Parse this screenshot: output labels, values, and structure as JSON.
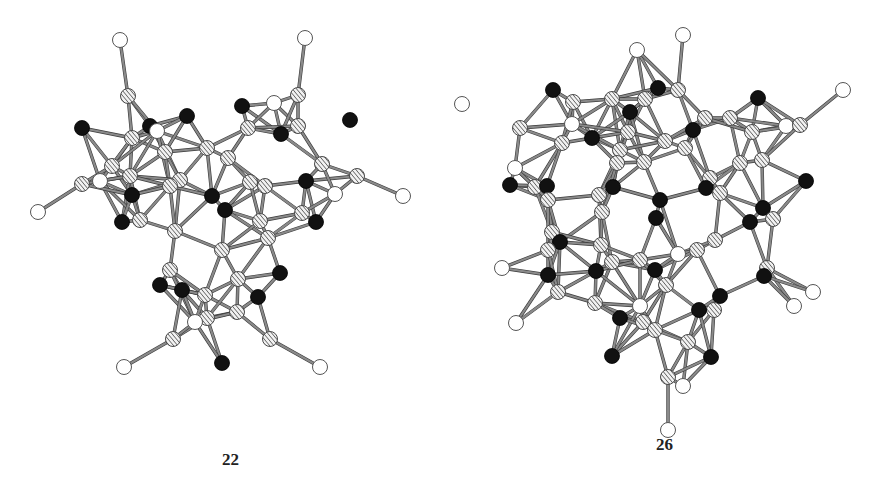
{
  "figure": {
    "structures": [
      {
        "id": "left",
        "label": "22",
        "atom_types": {
          "black": "#111111",
          "hatched": "striped gray",
          "white": "#ffffff"
        },
        "atoms": [
          {
            "t": "w",
            "x": 120,
            "y": 40
          },
          {
            "t": "h",
            "x": 128,
            "y": 96
          },
          {
            "t": "b",
            "x": 82,
            "y": 128
          },
          {
            "t": "h",
            "x": 132,
            "y": 138
          },
          {
            "t": "b",
            "x": 150,
            "y": 126
          },
          {
            "t": "w",
            "x": 157,
            "y": 131
          },
          {
            "t": "b",
            "x": 187,
            "y": 116
          },
          {
            "t": "b",
            "x": 242,
            "y": 106
          },
          {
            "t": "w",
            "x": 274,
            "y": 103
          },
          {
            "t": "h",
            "x": 298,
            "y": 95
          },
          {
            "t": "w",
            "x": 305,
            "y": 38
          },
          {
            "t": "b",
            "x": 350,
            "y": 120
          },
          {
            "t": "h",
            "x": 298,
            "y": 126
          },
          {
            "t": "b",
            "x": 281,
            "y": 134
          },
          {
            "t": "h",
            "x": 248,
            "y": 128
          },
          {
            "t": "h",
            "x": 207,
            "y": 148
          },
          {
            "t": "h",
            "x": 228,
            "y": 158
          },
          {
            "t": "h",
            "x": 165,
            "y": 152
          },
          {
            "t": "h",
            "x": 112,
            "y": 166
          },
          {
            "t": "h",
            "x": 130,
            "y": 176
          },
          {
            "t": "w",
            "x": 100,
            "y": 181
          },
          {
            "t": "h",
            "x": 82,
            "y": 184
          },
          {
            "t": "w",
            "x": 38,
            "y": 212
          },
          {
            "t": "b",
            "x": 132,
            "y": 195
          },
          {
            "t": "h",
            "x": 180,
            "y": 180
          },
          {
            "t": "h",
            "x": 170,
            "y": 186
          },
          {
            "t": "b",
            "x": 212,
            "y": 196
          },
          {
            "t": "b",
            "x": 225,
            "y": 210
          },
          {
            "t": "h",
            "x": 250,
            "y": 182
          },
          {
            "t": "h",
            "x": 265,
            "y": 186
          },
          {
            "t": "b",
            "x": 306,
            "y": 181
          },
          {
            "t": "w",
            "x": 335,
            "y": 194
          },
          {
            "t": "h",
            "x": 357,
            "y": 176
          },
          {
            "t": "w",
            "x": 403,
            "y": 196
          },
          {
            "t": "h",
            "x": 322,
            "y": 164
          },
          {
            "t": "h",
            "x": 302,
            "y": 213
          },
          {
            "t": "h",
            "x": 260,
            "y": 221
          },
          {
            "t": "b",
            "x": 316,
            "y": 222
          },
          {
            "t": "b",
            "x": 122,
            "y": 222
          },
          {
            "t": "h",
            "x": 140,
            "y": 220
          },
          {
            "t": "h",
            "x": 175,
            "y": 231
          },
          {
            "t": "h",
            "x": 268,
            "y": 238
          },
          {
            "t": "h",
            "x": 222,
            "y": 250
          },
          {
            "t": "h",
            "x": 170,
            "y": 270
          },
          {
            "t": "b",
            "x": 160,
            "y": 285
          },
          {
            "t": "b",
            "x": 182,
            "y": 290
          },
          {
            "t": "h",
            "x": 205,
            "y": 295
          },
          {
            "t": "h",
            "x": 238,
            "y": 279
          },
          {
            "t": "b",
            "x": 280,
            "y": 273
          },
          {
            "t": "b",
            "x": 258,
            "y": 297
          },
          {
            "t": "h",
            "x": 207,
            "y": 318
          },
          {
            "t": "h",
            "x": 237,
            "y": 312
          },
          {
            "t": "w",
            "x": 195,
            "y": 322
          },
          {
            "t": "h",
            "x": 173,
            "y": 339
          },
          {
            "t": "h",
            "x": 270,
            "y": 339
          },
          {
            "t": "b",
            "x": 222,
            "y": 363
          },
          {
            "t": "w",
            "x": 124,
            "y": 367
          },
          {
            "t": "w",
            "x": 320,
            "y": 367
          }
        ]
      },
      {
        "id": "right",
        "label": "26",
        "atom_types": {
          "black": "#111111",
          "hatched": "striped gray",
          "white": "#ffffff"
        },
        "atoms": [
          {
            "t": "w",
            "x": 683,
            "y": 35
          },
          {
            "t": "w",
            "x": 637,
            "y": 50
          },
          {
            "t": "b",
            "x": 553,
            "y": 90
          },
          {
            "t": "b",
            "x": 658,
            "y": 88
          },
          {
            "t": "h",
            "x": 678,
            "y": 90
          },
          {
            "t": "h",
            "x": 573,
            "y": 102
          },
          {
            "t": "h",
            "x": 612,
            "y": 99
          },
          {
            "t": "h",
            "x": 645,
            "y": 99
          },
          {
            "t": "b",
            "x": 630,
            "y": 112
          },
          {
            "t": "w",
            "x": 462,
            "y": 104
          },
          {
            "t": "w",
            "x": 843,
            "y": 90
          },
          {
            "t": "b",
            "x": 758,
            "y": 98
          },
          {
            "t": "h",
            "x": 730,
            "y": 118
          },
          {
            "t": "b",
            "x": 592,
            "y": 138
          },
          {
            "t": "b",
            "x": 693,
            "y": 130
          },
          {
            "t": "h",
            "x": 520,
            "y": 128
          },
          {
            "t": "w",
            "x": 572,
            "y": 124
          },
          {
            "t": "h",
            "x": 628,
            "y": 132
          },
          {
            "t": "h",
            "x": 705,
            "y": 118
          },
          {
            "t": "w",
            "x": 786,
            "y": 126
          },
          {
            "t": "h",
            "x": 800,
            "y": 125
          },
          {
            "t": "h",
            "x": 752,
            "y": 132
          },
          {
            "t": "h",
            "x": 562,
            "y": 143
          },
          {
            "t": "h",
            "x": 665,
            "y": 141
          },
          {
            "t": "h",
            "x": 685,
            "y": 148
          },
          {
            "t": "h",
            "x": 620,
            "y": 150
          },
          {
            "t": "h",
            "x": 617,
            "y": 163
          },
          {
            "t": "h",
            "x": 644,
            "y": 162
          },
          {
            "t": "w",
            "x": 515,
            "y": 168
          },
          {
            "t": "h",
            "x": 740,
            "y": 163
          },
          {
            "t": "h",
            "x": 762,
            "y": 160
          },
          {
            "t": "b",
            "x": 510,
            "y": 185
          },
          {
            "t": "h",
            "x": 535,
            "y": 187
          },
          {
            "t": "b",
            "x": 547,
            "y": 186
          },
          {
            "t": "h",
            "x": 710,
            "y": 178
          },
          {
            "t": "b",
            "x": 613,
            "y": 187
          },
          {
            "t": "b",
            "x": 706,
            "y": 188
          },
          {
            "t": "h",
            "x": 720,
            "y": 193
          },
          {
            "t": "b",
            "x": 806,
            "y": 181
          },
          {
            "t": "h",
            "x": 599,
            "y": 195
          },
          {
            "t": "b",
            "x": 660,
            "y": 200
          },
          {
            "t": "h",
            "x": 548,
            "y": 200
          },
          {
            "t": "b",
            "x": 763,
            "y": 208
          },
          {
            "t": "h",
            "x": 602,
            "y": 212
          },
          {
            "t": "b",
            "x": 656,
            "y": 218
          },
          {
            "t": "h",
            "x": 773,
            "y": 219
          },
          {
            "t": "b",
            "x": 750,
            "y": 222
          },
          {
            "t": "h",
            "x": 552,
            "y": 232
          },
          {
            "t": "b",
            "x": 560,
            "y": 242
          },
          {
            "t": "h",
            "x": 601,
            "y": 245
          },
          {
            "t": "h",
            "x": 715,
            "y": 240
          },
          {
            "t": "h",
            "x": 697,
            "y": 250
          },
          {
            "t": "w",
            "x": 678,
            "y": 254
          },
          {
            "t": "h",
            "x": 612,
            "y": 262
          },
          {
            "t": "h",
            "x": 640,
            "y": 260
          },
          {
            "t": "h",
            "x": 548,
            "y": 250
          },
          {
            "t": "w",
            "x": 502,
            "y": 268
          },
          {
            "t": "b",
            "x": 548,
            "y": 275
          },
          {
            "t": "b",
            "x": 596,
            "y": 271
          },
          {
            "t": "b",
            "x": 655,
            "y": 270
          },
          {
            "t": "h",
            "x": 666,
            "y": 285
          },
          {
            "t": "h",
            "x": 767,
            "y": 268
          },
          {
            "t": "b",
            "x": 764,
            "y": 276
          },
          {
            "t": "w",
            "x": 813,
            "y": 292
          },
          {
            "t": "h",
            "x": 558,
            "y": 292
          },
          {
            "t": "h",
            "x": 595,
            "y": 303
          },
          {
            "t": "b",
            "x": 720,
            "y": 296
          },
          {
            "t": "h",
            "x": 714,
            "y": 310
          },
          {
            "t": "b",
            "x": 699,
            "y": 310
          },
          {
            "t": "h",
            "x": 643,
            "y": 322
          },
          {
            "t": "w",
            "x": 640,
            "y": 306
          },
          {
            "t": "w",
            "x": 794,
            "y": 306
          },
          {
            "t": "b",
            "x": 620,
            "y": 318
          },
          {
            "t": "w",
            "x": 516,
            "y": 323
          },
          {
            "t": "h",
            "x": 655,
            "y": 330
          },
          {
            "t": "h",
            "x": 688,
            "y": 342
          },
          {
            "t": "b",
            "x": 612,
            "y": 356
          },
          {
            "t": "b",
            "x": 711,
            "y": 357
          },
          {
            "t": "h",
            "x": 668,
            "y": 377
          },
          {
            "t": "w",
            "x": 683,
            "y": 386
          },
          {
            "t": "w",
            "x": 668,
            "y": 430
          }
        ]
      }
    ]
  }
}
